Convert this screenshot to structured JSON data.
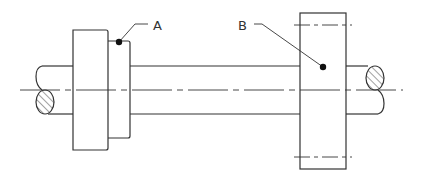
{
  "diagram": {
    "labels": {
      "a": "A",
      "b": "B"
    },
    "parts": [
      {
        "id": "shaft",
        "desc": "horizontal round shaft with broken ends and hatched cross-section"
      },
      {
        "id": "hub",
        "desc": "stepped hub / collar on left side",
        "label": "A"
      },
      {
        "id": "gear",
        "desc": "gear disc with pitch lines on right side",
        "label": "B"
      }
    ],
    "colors": {
      "line": "#333333",
      "background": "#ffffff"
    }
  }
}
